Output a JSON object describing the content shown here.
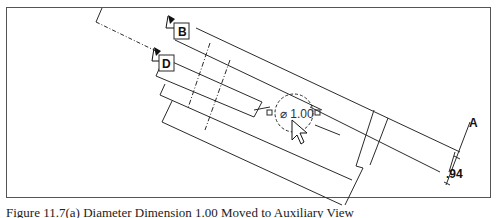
{
  "drawing": {
    "view_callouts": [
      {
        "label": "B"
      },
      {
        "label": "D"
      }
    ],
    "diameter_dimension": {
      "symbol": "⌀",
      "value": "1.00",
      "display": "⌀ 1.00"
    },
    "linear_dimension": {
      "value": ".94"
    },
    "section_label": {
      "label": "A"
    },
    "colors": {
      "line": "#2a2a2a",
      "frame": "#555555",
      "background": "#ffffff"
    }
  },
  "caption": {
    "text": "Figure 11.7(a) Diameter Dimension 1.00 Moved to Auxiliary View"
  }
}
